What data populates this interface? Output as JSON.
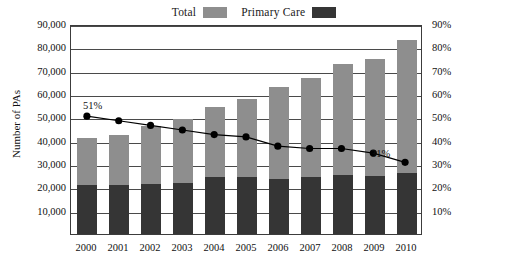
{
  "legend": {
    "entries": [
      {
        "label": "Total",
        "color": "#8e8e8e",
        "name": "legend-total"
      },
      {
        "label": "Primary Care",
        "color": "#353535",
        "name": "legend-primary-care"
      }
    ]
  },
  "axes": {
    "left_title": "Number of PAs",
    "right_title": "Percentage of PAs in Primary Care",
    "left_ticks": [
      "90,000",
      "80,000",
      "70,000",
      "60,000",
      "50,000",
      "40,000",
      "30,000",
      "20,000",
      "10,000"
    ],
    "right_ticks": [
      "90%",
      "80%",
      "70%",
      "60%",
      "50%",
      "40%",
      "30%",
      "20%",
      "10%"
    ]
  },
  "chart_data": {
    "type": "bar",
    "title": "",
    "subtitle": "",
    "xlabel": "",
    "ylabel": "Number of PAs",
    "y2label": "Percentage of PAs in Primary Care",
    "categories": [
      "2000",
      "2001",
      "2002",
      "2003",
      "2004",
      "2005",
      "2006",
      "2007",
      "2008",
      "2009",
      "2010"
    ],
    "ylim": [
      0,
      90000
    ],
    "y2lim": [
      0,
      90
    ],
    "ytick_step": 10000,
    "y2tick_step": 10,
    "grid": true,
    "legend_position": "top-center",
    "series": [
      {
        "name": "Total",
        "type": "bar-stacked-total",
        "color": "#8e8e8e",
        "axis": "left",
        "values": [
          41000,
          42500,
          46500,
          49500,
          54500,
          58000,
          63000,
          67000,
          73000,
          75000,
          83000
        ]
      },
      {
        "name": "Primary Care",
        "type": "bar-stacked-segment",
        "color": "#353535",
        "axis": "left",
        "values": [
          21000,
          21000,
          21500,
          22000,
          24500,
          24500,
          23500,
          24500,
          25500,
          25000,
          26000
        ]
      },
      {
        "name": "Percentage of PAs in Primary Care",
        "type": "line",
        "color": "#000000",
        "axis": "right",
        "values": [
          51,
          49,
          47,
          45,
          43,
          42,
          38,
          37,
          37,
          35,
          31
        ],
        "point_labels": {
          "2000": "51%",
          "2010": "31%"
        }
      }
    ]
  }
}
